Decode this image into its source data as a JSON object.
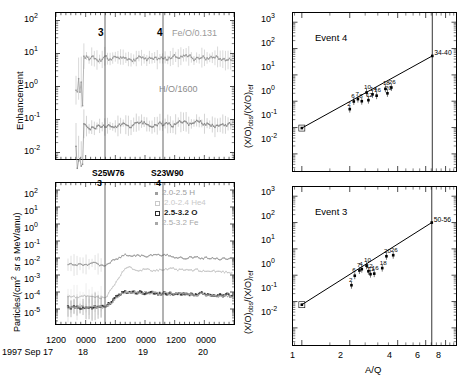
{
  "figure": {
    "panels": [
      "enhancement-timeseries",
      "intensity-timeseries",
      "event4-aq",
      "event3-aq"
    ]
  },
  "panel_enhancement": {
    "ylabel": "Enhancement",
    "ytick_labels": [
      "2",
      "1",
      "0",
      "-1",
      "-2"
    ],
    "ytick_base": "10",
    "series_labels": [
      {
        "name": "fe-o-label",
        "text": "Fe/O/0.131",
        "color": "#9a9a9a"
      },
      {
        "name": "h-o-label",
        "text": "H/O/1600",
        "color": "#8c8c8c"
      }
    ],
    "event_markers": [
      {
        "label": "3",
        "x_frac": 0.276
      },
      {
        "label": "4",
        "x_frac": 0.602
      }
    ],
    "chart_data": {
      "type": "line",
      "title": "Enhancement",
      "xlabel": "",
      "ylabel": "Enhancement",
      "ylim": [
        -2.3,
        2.2
      ],
      "xlim": [
        0,
        1
      ],
      "log_y": true,
      "grid": false,
      "series": [
        {
          "name": "Fe/O/0.131",
          "color": "#9a9a9a",
          "approx_level_log10": 0.85
        },
        {
          "name": "H/O/1600",
          "color": "#8c8c8c",
          "approx_level_log10": -1.15
        }
      ]
    }
  },
  "panel_intensity": {
    "ylabel": "Particles/(cm² sr s MeV/amu)",
    "ytick_labels": [
      "2",
      "1",
      "0",
      "-1",
      "-2",
      "-3",
      "-4",
      "-5"
    ],
    "ytick_base": "10",
    "event_annotations": [
      {
        "coord": "S25W76",
        "num": "3",
        "x_frac": 0.276
      },
      {
        "coord": "S23W90",
        "num": "4",
        "x_frac": 0.602
      }
    ],
    "legend": [
      {
        "text": "2.0-2.5 H",
        "color": "#9e9e9e",
        "marker": "dot"
      },
      {
        "text": "2.0-2.4 He4",
        "color": "#c9c9c9",
        "marker": "open-square"
      },
      {
        "text": "2.5-3.2 O",
        "color": "#2b2b2b",
        "marker": "open-square"
      },
      {
        "text": "2.5-3.2 Fe",
        "color": "#a8a8a8",
        "marker": "dot"
      }
    ],
    "xaxis": {
      "tick_times": [
        "1200",
        "0000",
        "1200",
        "0000",
        "1200",
        "0000"
      ],
      "date_prefix": "1997 Sep 17",
      "day_labels": [
        "18",
        "19",
        "20"
      ]
    },
    "chart_data": {
      "type": "line",
      "title": "",
      "xlabel": "1997 Sep 17 - 20",
      "ylabel": "Particles/(cm2 sr s MeV/amu)",
      "ylim": [
        -5.6,
        2.3
      ],
      "log_y": true,
      "grid": false,
      "series": [
        {
          "name": "2.0-2.5 H",
          "color": "#9e9e9e",
          "pre_event_log10": -2.4,
          "post_event_log10": -1.8
        },
        {
          "name": "2.0-2.4 He4",
          "color": "#c9c9c9",
          "pre_event_log10": -4.3,
          "post_event_log10": -2.6
        },
        {
          "name": "2.5-3.2 O",
          "color": "#2b2b2b",
          "pre_event_log10": -4.9,
          "post_event_log10": -4.0
        },
        {
          "name": "2.5-3.2 Fe",
          "color": "#a8a8a8",
          "pre_event_log10": -4.9,
          "post_event_log10": -4.0
        }
      ]
    }
  },
  "panel_event4": {
    "title": "Event 4",
    "ylabel_parts": {
      "main": "(X/O)",
      "sub1": "obs",
      "slash": "/(X/O)",
      "sub2": "ref"
    },
    "ytick_labels": [
      "3",
      "2",
      "1",
      "0",
      "-1",
      "-2"
    ],
    "ytick_base": "10",
    "corner_label": "34-40",
    "chart_data": {
      "type": "scatter",
      "title": "Event 4",
      "xlabel": "A/Q",
      "ylabel": "(X/O)obs/(X/O)ref",
      "log_x": true,
      "log_y": true,
      "xlim": [
        0.9,
        9
      ],
      "ylim": [
        -2.6,
        3.3
      ],
      "grid": false,
      "fit_line": {
        "x": [
          1.0,
          6.6
        ],
        "y_log10": [
          -1.02,
          1.72
        ]
      },
      "points": [
        {
          "label": "1",
          "aq": 1.0,
          "ratio_log10": -1.02
        },
        {
          "label": "2",
          "aq": 2.0,
          "ratio_log10": -0.3
        },
        {
          "label": "6",
          "aq": 2.12,
          "ratio_log10": -0.01
        },
        {
          "label": "7",
          "aq": 2.25,
          "ratio_log10": 0.08
        },
        {
          "label": "8",
          "aq": 2.38,
          "ratio_log10": 0.0
        },
        {
          "label": "10",
          "aq": 2.55,
          "ratio_log10": 0.33
        },
        {
          "label": "12",
          "aq": 2.62,
          "ratio_log10": 0.04
        },
        {
          "label": "14",
          "aq": 2.78,
          "ratio_log10": 0.26
        },
        {
          "label": "16",
          "aq": 2.95,
          "ratio_log10": 0.21
        },
        {
          "label": "18",
          "aq": 3.35,
          "ratio_log10": 0.47
        },
        {
          "label": "20",
          "aq": 3.45,
          "ratio_log10": 0.3
        },
        {
          "label": "26",
          "aq": 3.65,
          "ratio_log10": 0.52
        },
        {
          "label": "34-40",
          "aq": 6.6,
          "ratio_log10": 1.72
        }
      ]
    }
  },
  "panel_event3": {
    "title": "Event 3",
    "ylabel_parts": {
      "main": "(X/O)",
      "sub1": "obs",
      "slash": "/(X/O)",
      "sub2": "ref"
    },
    "ytick_labels": [
      "3",
      "2",
      "1",
      "0",
      "-1",
      "-2"
    ],
    "ytick_base": "10",
    "corner_label": "50-56",
    "xlabel": "A/Q",
    "xtick_labels": [
      "1",
      "2",
      "4",
      "6",
      "8"
    ],
    "chart_data": {
      "type": "scatter",
      "title": "Event 3",
      "xlabel": "A/Q",
      "ylabel": "(X/O)obs/(X/O)ref",
      "log_x": true,
      "log_y": true,
      "xlim": [
        0.9,
        9
      ],
      "ylim": [
        -2.6,
        3.3
      ],
      "grid": false,
      "fit_line": {
        "x": [
          1.0,
          6.55
        ],
        "y_log10": [
          -1.12,
          2.0
        ]
      },
      "points": [
        {
          "label": "1",
          "aq": 1.0,
          "ratio_log10": -1.12
        },
        {
          "label": "2",
          "aq": 2.05,
          "ratio_log10": -0.38
        },
        {
          "label": "6",
          "aq": 2.15,
          "ratio_log10": -0.02
        },
        {
          "label": "7",
          "aq": 2.3,
          "ratio_log10": 0.18
        },
        {
          "label": "4",
          "aq": 2.38,
          "ratio_log10": 0.23
        },
        {
          "label": "10",
          "aq": 2.55,
          "ratio_log10": 0.36
        },
        {
          "label": "12",
          "aq": 2.62,
          "ratio_log10": 0.15
        },
        {
          "label": "11",
          "aq": 2.7,
          "ratio_log10": 0.04
        },
        {
          "label": "16",
          "aq": 2.85,
          "ratio_log10": 0.06
        },
        {
          "label": "18",
          "aq": 3.2,
          "ratio_log10": 0.27
        },
        {
          "label": "20",
          "aq": 3.4,
          "ratio_log10": 0.72
        },
        {
          "label": "26",
          "aq": 3.75,
          "ratio_log10": 0.76
        },
        {
          "label": "50-56",
          "aq": 6.55,
          "ratio_log10": 2.0
        }
      ]
    }
  }
}
